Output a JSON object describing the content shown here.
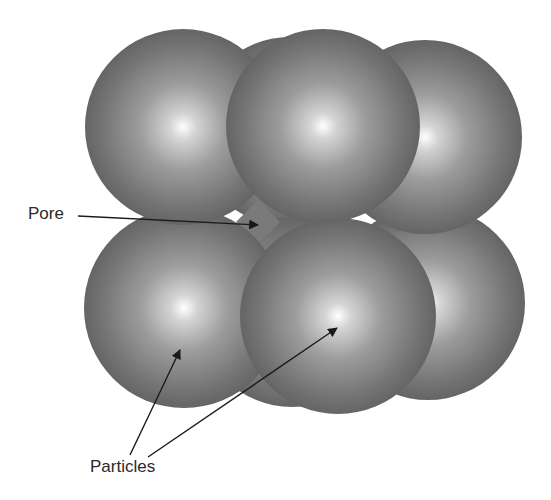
{
  "diagram": {
    "type": "particle-packing-illustration",
    "labels": {
      "pore": "Pore",
      "particles": "Particles"
    },
    "colors": {
      "sphere_dark": "#5e5e5e",
      "sphere_mid": "#8a8a8a",
      "sphere_highlight": "#ffffff",
      "pore_fill": "#7a7a7a",
      "arrow": "#1a1a1a",
      "text": "#2a2a2a"
    },
    "spheres": [
      {
        "id": "top-back",
        "cx": 290,
        "cy": 132,
        "r": 95
      },
      {
        "id": "bottom-back",
        "cx": 292,
        "cy": 312,
        "r": 95
      },
      {
        "id": "bottom-right",
        "cx": 428,
        "cy": 303,
        "r": 97
      },
      {
        "id": "bottom-left",
        "cx": 184,
        "cy": 308,
        "r": 100
      },
      {
        "id": "bottom-middle",
        "cx": 338,
        "cy": 316,
        "r": 98
      },
      {
        "id": "top-right",
        "cx": 425,
        "cy": 137,
        "r": 97
      },
      {
        "id": "top-left",
        "cx": 183,
        "cy": 127,
        "r": 98
      },
      {
        "id": "top-middle",
        "cx": 323,
        "cy": 126,
        "r": 97
      }
    ],
    "pore": {
      "cx": 258,
      "cy": 222,
      "half": 22
    },
    "arrows": [
      {
        "id": "pore-arrow",
        "from": [
          78,
          216
        ],
        "to": [
          258,
          225
        ]
      },
      {
        "id": "particle-arrow-left",
        "from": [
          130,
          455
        ],
        "to": [
          180,
          350
        ]
      },
      {
        "id": "particle-arrow-right",
        "from": [
          148,
          457
        ],
        "to": [
          337,
          328
        ]
      }
    ]
  }
}
